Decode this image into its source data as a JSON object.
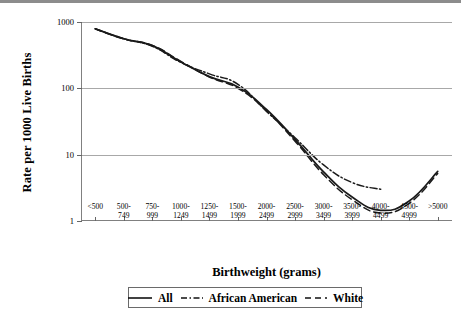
{
  "chart_data": {
    "type": "line",
    "title": "",
    "xlabel": "Birthweight (grams)",
    "ylabel": "Rate per 1000 Live Births",
    "yscale": "log",
    "ylim": [
      1,
      1000
    ],
    "yticks": [
      1,
      10,
      100,
      1000
    ],
    "ytick_labels": [
      "1",
      "10",
      "100",
      "1000"
    ],
    "grid": true,
    "legend_position": "bottom",
    "categories": [
      "<500",
      "500-749",
      "750-999",
      "1000-1249",
      "1250-1499",
      "1500-1999",
      "2000-2499",
      "2500-2999",
      "3000-3499",
      "3500-3999",
      "4000-4499",
      "4500-4999",
      ">5000"
    ],
    "series": [
      {
        "name": "All",
        "style": "solid",
        "color": "#1a1a1a",
        "values": [
          790,
          560,
          440,
          250,
          150,
          105,
          48,
          17,
          5.5,
          2.3,
          1.45,
          2.0,
          5.6
        ]
      },
      {
        "name": "African American",
        "style": "dash-dot",
        "color": "#1a1a1a",
        "values": [
          790,
          560,
          430,
          245,
          165,
          115,
          45,
          18,
          7.0,
          3.8,
          3.0,
          null,
          null
        ]
      },
      {
        "name": "White",
        "style": "dashed",
        "color": "#1a1a1a",
        "values": [
          790,
          555,
          445,
          255,
          148,
          100,
          46,
          16,
          5.0,
          2.1,
          1.32,
          1.85,
          5.2
        ]
      }
    ]
  },
  "legend": {
    "entries": [
      {
        "label": "All",
        "swatch": "solid-line-swatch"
      },
      {
        "label": "African American",
        "swatch": "dash-dot-line-swatch"
      },
      {
        "label": "White",
        "swatch": "dashed-line-swatch"
      }
    ]
  }
}
